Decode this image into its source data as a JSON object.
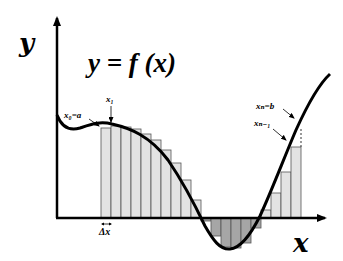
{
  "diagram": {
    "formula": "y = f (x)",
    "axis_labels": {
      "x": "x",
      "y": "y"
    },
    "point_labels": {
      "x0": "x₀=a",
      "x1": "x₁",
      "xn": "xₙ=b",
      "xn_minus_1": "xₙ₋₁",
      "delta_x": "Δx"
    },
    "colors": {
      "curve": "#000000",
      "axes": "#000000",
      "positive_bar_fill": "#e3e3e3",
      "negative_bar_fill": "#a6a6a6",
      "bar_stroke": "#555555",
      "background": "#ffffff"
    },
    "rectangles": {
      "count": 20,
      "bar_width_px": 10,
      "first_left_px": 101,
      "axis_y_px": 218,
      "tops_px": [
        128,
        126,
        127,
        129,
        134,
        140,
        150,
        163,
        180,
        200,
        221,
        236,
        247,
        248,
        243,
        228,
        210,
        193,
        172,
        147
      ]
    }
  }
}
